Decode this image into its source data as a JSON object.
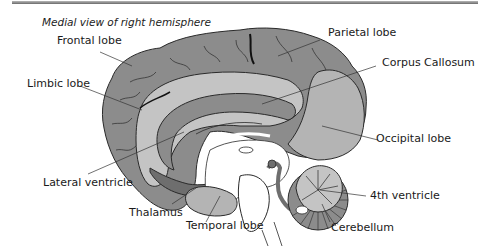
{
  "title": "Medial view of right hemisphere",
  "labels": {
    "frontal": "Frontal lobe",
    "parietal": "Parietal lobe",
    "corpus": "Corpus Callosum",
    "limbic": "Limbic lobe",
    "occipital": "Occipital lobe",
    "lateral_ventricle": "Lateral ventricle",
    "fourth_ventricle": "4th ventricle",
    "thalamus": "Thalamus",
    "temporal": "Temporal lobe",
    "cerebellum": "Cerebellum"
  },
  "colors": {
    "cortex": "#8c8c8c",
    "inner": "#c4c4c4",
    "ventricle": "#7a7a7a",
    "outline": "#2a2a2a",
    "white": "#ffffff"
  }
}
